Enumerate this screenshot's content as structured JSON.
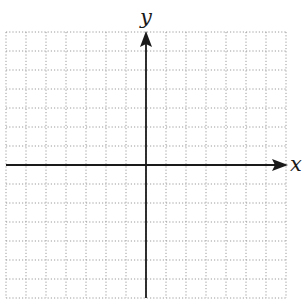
{
  "diagram": {
    "type": "coordinate-plane",
    "x_axis_label": "x",
    "y_axis_label": "y",
    "grid": {
      "columns": 14,
      "rows": 14,
      "cells_left_of_y_axis": 7,
      "cells_right_of_y_axis": 7,
      "cells_above_x_axis": 7,
      "cells_below_x_axis": 7,
      "line_style": "dotted",
      "line_color": "#9a9a9a"
    },
    "axis_color": "#1a1a1a",
    "arrows": {
      "x_axis": "positive-direction",
      "y_axis": "positive-direction"
    },
    "tick_labels": []
  }
}
